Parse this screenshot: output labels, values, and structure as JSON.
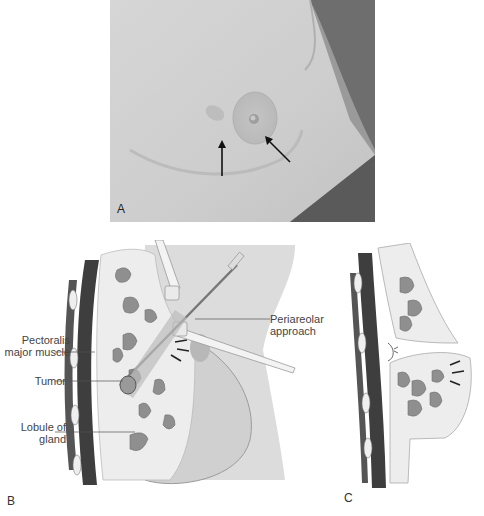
{
  "figure": {
    "panels": [
      {
        "id": "A",
        "label": "A",
        "type": "photograph",
        "description": "Clinical photo of breast with two arrows indicating skin retraction near areola"
      },
      {
        "id": "B",
        "label": "B",
        "type": "illustration",
        "description": "Sagittal illustration of periareolar surgical approach to tumor"
      },
      {
        "id": "C",
        "label": "C",
        "type": "illustration",
        "description": "Sagittal illustration after excision showing flap and suture"
      }
    ],
    "annotations_b": {
      "pectoralis_line1": "Pectoralis",
      "pectoralis_line2": "major muscle",
      "tumor": "Tumor",
      "lobule_line1": "Lobule of",
      "lobule_line2": "gland",
      "periareolar_line1": "Periareolar",
      "periareolar_line2": "approach"
    },
    "colors": {
      "skin_photo": "#cfcfcf",
      "background_photo": "#9a9a9a",
      "muscle": "#3e3e3e",
      "lobule": "#8f8f8f",
      "breast_tissue": "#ededed",
      "skin_illustration": "#d9d9d9"
    }
  }
}
